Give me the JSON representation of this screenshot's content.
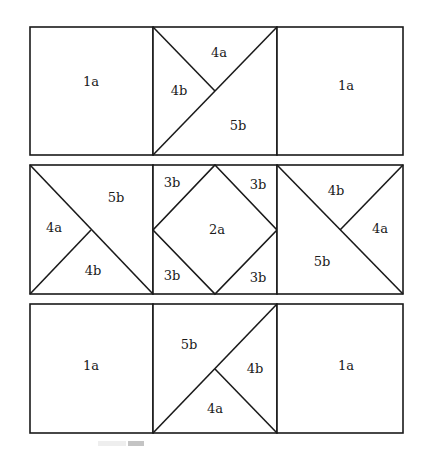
{
  "diagram": {
    "rows": [
      {
        "blocks": [
          {
            "type": "plain",
            "labels": [
              "1a"
            ]
          },
          {
            "type": "triangles-top-left-split",
            "labels": [
              "4a",
              "4b",
              "5b"
            ]
          },
          {
            "type": "plain",
            "labels": [
              "1a"
            ]
          }
        ]
      },
      {
        "blocks": [
          {
            "type": "triangles-left-split",
            "labels": [
              "5b",
              "4a",
              "4b"
            ]
          },
          {
            "type": "square-in-square",
            "labels": [
              "3b",
              "3b",
              "2a",
              "3b",
              "3b"
            ]
          },
          {
            "type": "triangles-right-split",
            "labels": [
              "4b",
              "4a",
              "5b"
            ]
          }
        ]
      },
      {
        "blocks": [
          {
            "type": "plain",
            "labels": [
              "1a"
            ]
          },
          {
            "type": "triangles-bottom-right-split",
            "labels": [
              "5b",
              "4b",
              "4a"
            ]
          },
          {
            "type": "plain",
            "labels": [
              "1a"
            ]
          }
        ]
      }
    ]
  }
}
